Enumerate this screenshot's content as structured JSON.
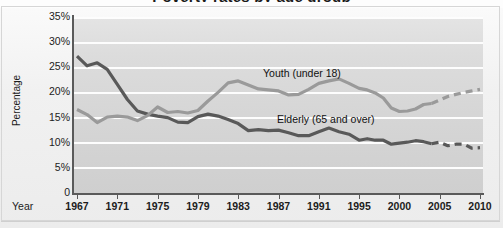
{
  "chart": {
    "title_partial": "",
    "axis": {
      "ylabel": "Percentage",
      "xlabel": "Year",
      "yticks": [
        "35%",
        "30%",
        "25%",
        "20%",
        "15%",
        "10%",
        "5%",
        "0"
      ],
      "xticks": [
        "1967",
        "1971",
        "1975",
        "1979",
        "1983",
        "1987",
        "1991",
        "1995",
        "2000",
        "2005",
        "2010"
      ]
    },
    "labels": {
      "youth": "Youth (under 18)",
      "elderly": "Elderly (65 and over)"
    },
    "colors": {
      "elderly_line": "#595959",
      "youth_line": "#9a9a9a",
      "plot_background": "#dcdcdc",
      "gridline": "#fdfdfd",
      "axis": "#5a5a5a",
      "page_background": "#f2f2f2"
    }
  },
  "chart_data": {
    "type": "line",
    "title": "Poverty rates by age group",
    "xlabel": "Year",
    "ylabel": "Percentage",
    "xlim": [
      1967,
      2010
    ],
    "ylim": [
      0,
      35
    ],
    "yticks": [
      0,
      5,
      10,
      15,
      20,
      25,
      30,
      35
    ],
    "ytick_labels": [
      "0",
      "5%",
      "10%",
      "15%",
      "20%",
      "25%",
      "30%",
      "35%"
    ],
    "xticks": [
      1967,
      1971,
      1975,
      1979,
      1983,
      1987,
      1991,
      1995,
      2000,
      2005,
      2010
    ],
    "grid": true,
    "legend": "inline-annotations",
    "series": [
      {
        "name": "Elderly (65 and over)",
        "color": "#595959",
        "style": "solid-with-dashed-projection",
        "projection_start_year": 2004,
        "x": [
          1967,
          1968,
          1969,
          1970,
          1971,
          1972,
          1973,
          1974,
          1975,
          1976,
          1977,
          1978,
          1979,
          1980,
          1981,
          1982,
          1983,
          1984,
          1985,
          1986,
          1987,
          1988,
          1989,
          1990,
          1991,
          1992,
          1993,
          1994,
          1995,
          1996,
          1997,
          1998,
          1999,
          2000,
          2001,
          2002,
          2003,
          2004,
          2005,
          2006,
          2007,
          2008,
          2009,
          2010
        ],
        "y": [
          27.2,
          25.3,
          25.9,
          24.6,
          21.6,
          18.6,
          16.3,
          15.7,
          15.3,
          15.0,
          14.1,
          14.0,
          15.2,
          15.7,
          15.3,
          14.6,
          13.8,
          12.4,
          12.6,
          12.4,
          12.5,
          12.0,
          11.4,
          11.4,
          12.2,
          12.9,
          12.2,
          11.7,
          10.5,
          10.8,
          10.5,
          10.5,
          9.7,
          9.9,
          10.1,
          10.4,
          10.2,
          9.8,
          10.1,
          9.4,
          9.7,
          9.7,
          8.9,
          9.0
        ]
      },
      {
        "name": "Youth (under 18)",
        "color": "#9a9a9a",
        "style": "solid-with-dashed-projection",
        "projection_start_year": 2004,
        "x": [
          1967,
          1968,
          1969,
          1970,
          1971,
          1972,
          1973,
          1974,
          1975,
          1976,
          1977,
          1978,
          1979,
          1980,
          1981,
          1982,
          1983,
          1984,
          1985,
          1986,
          1987,
          1988,
          1989,
          1990,
          1991,
          1992,
          1993,
          1994,
          1995,
          1996,
          1997,
          1998,
          1999,
          2000,
          2001,
          2002,
          2003,
          2004,
          2005,
          2006,
          2007,
          2008,
          2009,
          2010
        ],
        "y": [
          16.6,
          15.6,
          14.0,
          15.1,
          15.3,
          15.1,
          14.4,
          15.4,
          17.1,
          16.0,
          16.2,
          15.9,
          16.4,
          18.3,
          20.0,
          21.9,
          22.3,
          21.5,
          20.7,
          20.5,
          20.3,
          19.5,
          19.6,
          20.6,
          21.8,
          22.3,
          22.7,
          21.8,
          20.8,
          20.5,
          19.9,
          18.9,
          16.9,
          16.2,
          16.3,
          16.7,
          17.6,
          17.8,
          18.5,
          19.2,
          19.6,
          20.0,
          20.3,
          20.6
        ]
      }
    ]
  }
}
